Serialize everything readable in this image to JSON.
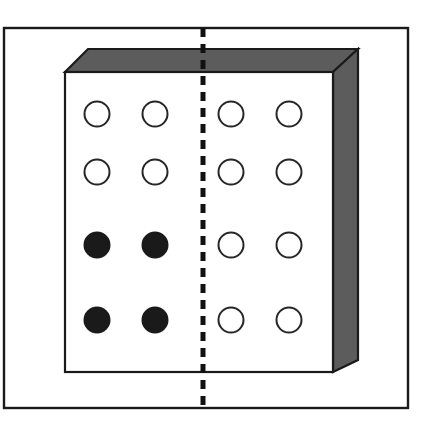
{
  "figure": {
    "canvas": {
      "width": 428,
      "height": 422,
      "background": "#ffffff"
    },
    "outer_frame": {
      "name": "outer-frame",
      "x": 4,
      "y": 28,
      "width": 404,
      "height": 380,
      "stroke": "#1a1a1a",
      "stroke_width": 2.4,
      "fill": "none"
    },
    "block": {
      "name": "three-dimensional-block",
      "front_face": {
        "x": 65,
        "y": 72,
        "width": 268,
        "height": 300,
        "fill": "#ffffff",
        "stroke": "#1a1a1a",
        "stroke_width": 2.2
      },
      "top_face": {
        "points": "65,72 88,49 358,49 333,72",
        "fill": "#5c5c5c",
        "stroke": "#1a1a1a",
        "stroke_width": 2.2
      },
      "right_face": {
        "points": "333,72 358,49 358,360 333,372",
        "fill": "#5c5c5c",
        "stroke": "#1a1a1a",
        "stroke_width": 2.2
      },
      "depth_offset_x": 25,
      "depth_offset_y": 23
    },
    "mirror_line": {
      "name": "dashed-mirror-line",
      "x": 203,
      "y_start": 28,
      "y_end": 408,
      "stroke": "#111111",
      "stroke_width": 5,
      "dash_length": 9,
      "gap_length": 7
    },
    "holes": {
      "radius": 12.5,
      "stroke": "#262626",
      "stroke_width": 2,
      "open_fill": "#ffffff",
      "filled_fill": "#1a1a1a",
      "columns_x": [
        97,
        155,
        231,
        289
      ],
      "rows_y": [
        114,
        172,
        245,
        320
      ],
      "grid": [
        {
          "row": 1,
          "y": 114,
          "cells": [
            {
              "cx": 97,
              "state": "open"
            },
            {
              "cx": 155,
              "state": "open"
            },
            {
              "cx": 231,
              "state": "open"
            },
            {
              "cx": 289,
              "state": "open"
            }
          ]
        },
        {
          "row": 2,
          "y": 172,
          "cells": [
            {
              "cx": 97,
              "state": "open"
            },
            {
              "cx": 155,
              "state": "open"
            },
            {
              "cx": 231,
              "state": "open"
            },
            {
              "cx": 289,
              "state": "open"
            }
          ]
        },
        {
          "row": 3,
          "y": 245,
          "cells": [
            {
              "cx": 97,
              "state": "filled"
            },
            {
              "cx": 155,
              "state": "filled"
            },
            {
              "cx": 231,
              "state": "open"
            },
            {
              "cx": 289,
              "state": "open"
            }
          ]
        },
        {
          "row": 4,
          "y": 320,
          "cells": [
            {
              "cx": 97,
              "state": "filled"
            },
            {
              "cx": 155,
              "state": "filled"
            },
            {
              "cx": 231,
              "state": "open"
            },
            {
              "cx": 289,
              "state": "open"
            }
          ]
        }
      ],
      "counts": {
        "total": 16,
        "open": 12,
        "filled": 4
      }
    }
  }
}
